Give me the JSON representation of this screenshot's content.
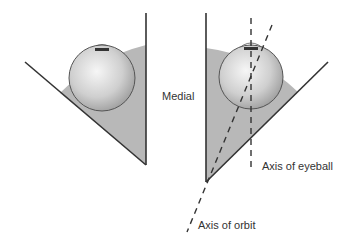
{
  "labels": {
    "medial": "Medial",
    "axis_eyeball": "Axis of eyeball",
    "axis_orbit": "Axis of orbit"
  },
  "colors": {
    "orbit_fill": "#b8b8b8",
    "line": "#333333",
    "eye_light": "#f4f4f4",
    "eye_dark": "#9a9a9a"
  }
}
